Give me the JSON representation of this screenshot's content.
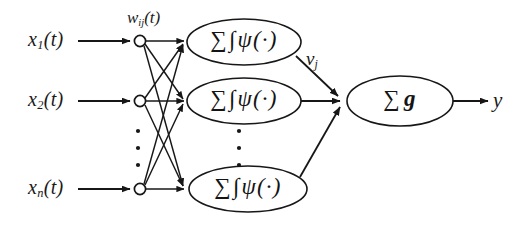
{
  "figure": {
    "background_color": "#ffffff",
    "ink_color": "#1a1a1a"
  },
  "inputs": [
    {
      "name": "input-1",
      "base": "x",
      "subscript": "1",
      "suffix": "(t)",
      "text": "x₁(t)",
      "x": 28,
      "y": 28
    },
    {
      "name": "input-2",
      "base": "x",
      "subscript": "2",
      "suffix": "(t)",
      "text": "x₂(t)",
      "x": 28,
      "y": 88
    },
    {
      "name": "input-n",
      "base": "x",
      "subscript": "n",
      "suffix": "(t)",
      "text": "xₙ(t)",
      "x": 28,
      "y": 176
    }
  ],
  "weights": {
    "label_text": "w",
    "subscript": "ij",
    "suffix": "(t)",
    "full": "wᵢⱼ(t)"
  },
  "hidden_nodes": [
    {
      "name": "hidden-node-1",
      "sigma": "∑",
      "integral": "∫",
      "psi": "ψ(·)",
      "full": "∑ ∫ ψ(·)"
    },
    {
      "name": "hidden-node-2",
      "sigma": "∑",
      "integral": "∫",
      "psi": "ψ(·)",
      "full": "∑ ∫ ψ(·)"
    },
    {
      "name": "hidden-node-3",
      "sigma": "∑",
      "integral": "∫",
      "psi": "ψ(·)",
      "full": "∑ ∫ ψ(·)"
    }
  ],
  "hidden_output": {
    "label_base": "v",
    "subscript": "j",
    "full": "vⱼ"
  },
  "output_node": {
    "name": "output-node",
    "sigma": "∑",
    "g": "g",
    "full": "∑ g"
  },
  "output": {
    "label": "y"
  },
  "ellipsis": {
    "dot": "·",
    "count": 3
  }
}
